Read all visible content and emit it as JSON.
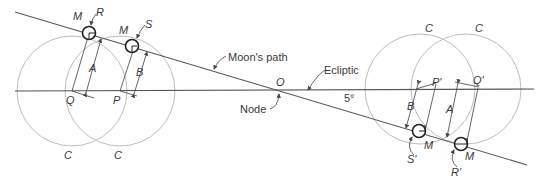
{
  "diagram": {
    "labels": {
      "moons_path": "Moon's path",
      "ecliptic": "Ecliptic",
      "node_point": "O",
      "node": "Node",
      "angle": "5°",
      "moon": "M",
      "R": "R",
      "S": "S",
      "R_prime": "R'",
      "S_prime": "S'",
      "Q": "Q",
      "P": "P",
      "Q_prime": "Q'",
      "P_prime": "P'",
      "A": "A",
      "B": "B",
      "C": "C"
    },
    "colors": {
      "line": "#555555",
      "circle": "#bdbdbd",
      "text": "#3a3a3a",
      "moon_outline": "#222222"
    }
  }
}
